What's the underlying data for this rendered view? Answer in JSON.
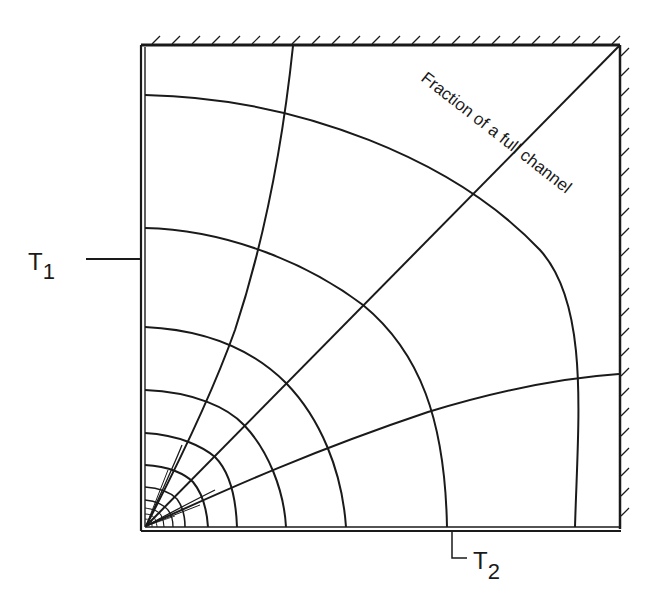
{
  "diagram": {
    "type": "flux-plot",
    "labels": {
      "t1": "T",
      "t1_sub": "1",
      "t2": "T",
      "t2_sub": "2",
      "fraction": "Fraction of a full channel"
    },
    "colors": {
      "line": "#1a1a1a",
      "background": "#ffffff"
    },
    "boundaries": {
      "left": "isotherm T1",
      "bottom": "isotherm T2",
      "top": "adiabatic (hatched)",
      "right": "adiabatic (hatched)"
    }
  }
}
